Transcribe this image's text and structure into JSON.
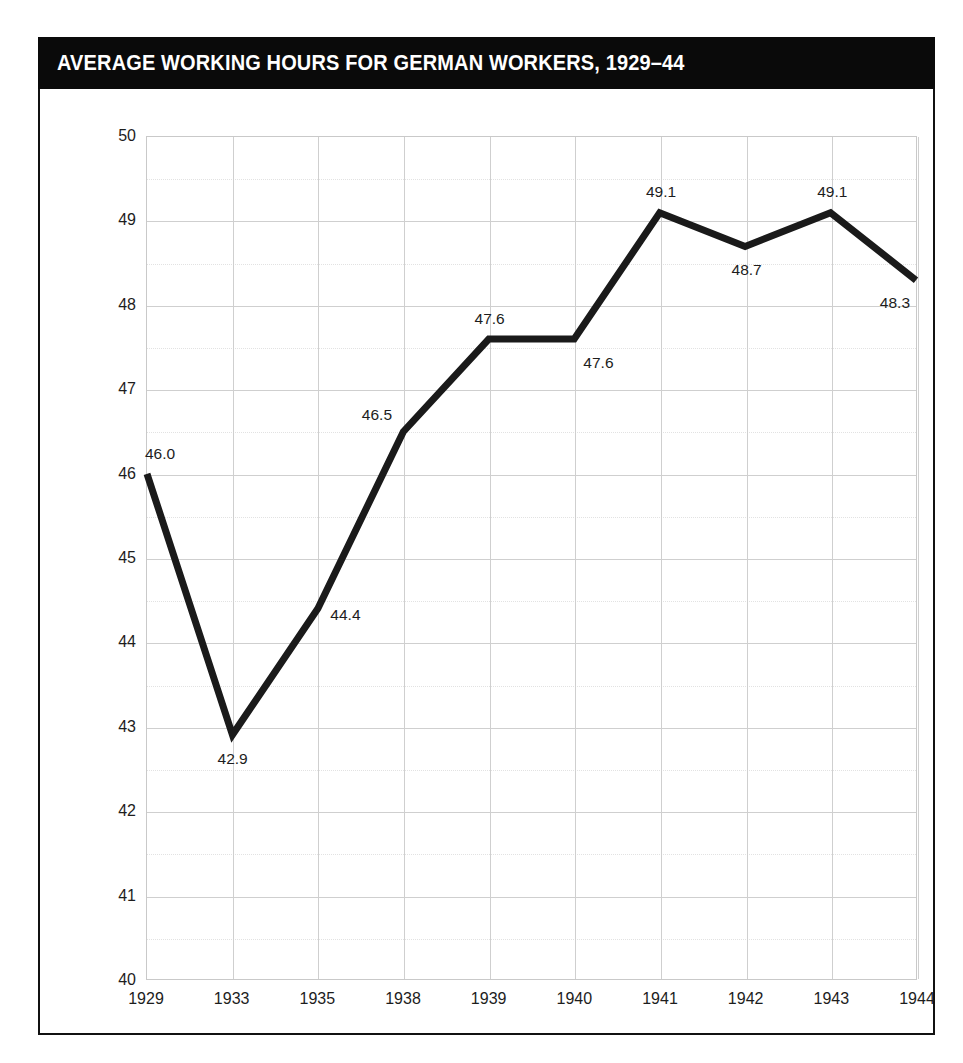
{
  "header": {
    "title": "AVERAGE WORKING HOURS FOR GERMAN WORKERS, 1929–44"
  },
  "colors": {
    "banner_background": "#0a0a0a",
    "banner_text": "#ffffff",
    "line": "#1a1a1a",
    "grid_major": "#cfcfcf",
    "grid_minor": "#e2e2e2",
    "frame": "#111111",
    "tick_text": "#1d1d1d",
    "plot_background": "#ffffff"
  },
  "chart_data": {
    "type": "line",
    "title": "AVERAGE WORKING HOURS FOR GERMAN WORKERS, 1929–44",
    "subtitle": "",
    "xlabel": "",
    "ylabel": "",
    "categories": [
      "1929",
      "1933",
      "1935",
      "1938",
      "1939",
      "1940",
      "1941",
      "1942",
      "1943",
      "1944"
    ],
    "values": [
      46.0,
      42.9,
      44.4,
      46.5,
      47.6,
      47.6,
      49.1,
      48.7,
      49.1,
      48.3
    ],
    "point_labels": [
      "46.0",
      "42.9",
      "44.4",
      "46.5",
      "47.6",
      "47.6",
      "49.1",
      "48.7",
      "49.1",
      "48.3"
    ],
    "label_positions": [
      "above-right",
      "below",
      "right",
      "left",
      "above",
      "below-right",
      "above",
      "below",
      "above",
      "below-left"
    ],
    "ylim": [
      40,
      50
    ],
    "ytick_labels": [
      "50",
      "49",
      "48",
      "47",
      "46",
      "45",
      "44",
      "43",
      "42",
      "41",
      "40"
    ],
    "ytick_values": [
      50,
      49,
      48,
      47,
      46,
      45,
      44,
      43,
      42,
      41,
      40
    ],
    "minor_tick_step": 0.5,
    "grid": true,
    "legend": false,
    "legend_position": "none",
    "series": [
      {
        "name": "Average working hours per week",
        "values": [
          46.0,
          42.9,
          44.4,
          46.5,
          47.6,
          47.6,
          49.1,
          48.7,
          49.1,
          48.3
        ]
      }
    ]
  }
}
